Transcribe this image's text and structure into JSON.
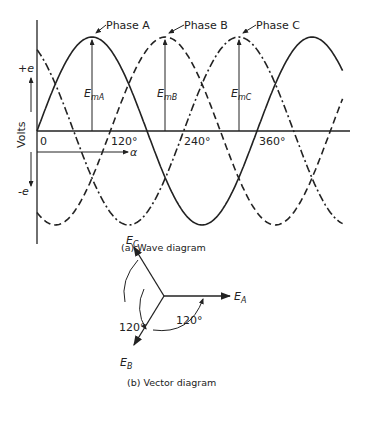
{
  "wave_diagram": {
    "caption": "(a) Wave diagram",
    "y_axis_label": "Volts",
    "y_plus": "+e",
    "y_minus": "-e",
    "x_var": "α",
    "x_ticks": [
      "0",
      "120°",
      "240°",
      "360°"
    ],
    "phases": [
      {
        "name": "Phase A",
        "peak_label": "E",
        "peak_sub": "mA",
        "style": "solid"
      },
      {
        "name": "Phase B",
        "peak_label": "E",
        "peak_sub": "mB",
        "style": "dashed"
      },
      {
        "name": "Phase C",
        "peak_label": "E",
        "peak_sub": "mC",
        "style": "dash-dot"
      }
    ]
  },
  "vector_diagram": {
    "caption": "(b) Vector diagram",
    "vectors": [
      {
        "label": "E",
        "sub": "A",
        "angle_deg": 0
      },
      {
        "label": "E",
        "sub": "B",
        "angle_deg": -120
      },
      {
        "label": "E",
        "sub": "C",
        "angle_deg": 120
      }
    ],
    "angle_labels": [
      "120°",
      "120°"
    ]
  },
  "chart_data": {
    "type": "line",
    "title": "(a) Wave diagram",
    "xlabel": "α",
    "ylabel": "Volts",
    "x_ticks": [
      "0",
      "120°",
      "240°",
      "360°"
    ],
    "x_range_deg": [
      -20,
      520
    ],
    "series": [
      {
        "name": "Phase A",
        "function": "sin(α)",
        "peak_at_deg": 90
      },
      {
        "name": "Phase B",
        "function": "sin(α-120°)",
        "peak_at_deg": 210
      },
      {
        "name": "Phase C",
        "function": "sin(α-240°)",
        "peak_at_deg": 330
      }
    ]
  }
}
